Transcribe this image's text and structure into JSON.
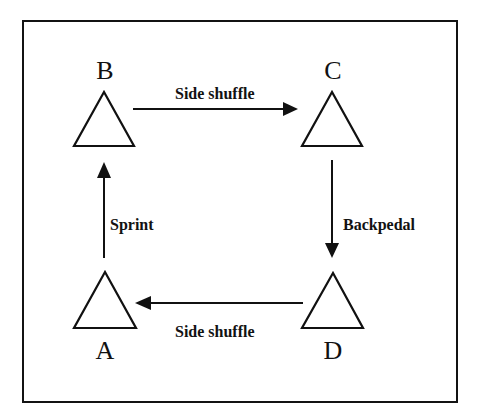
{
  "figure": {
    "type": "cycle-drill-diagram",
    "frame": {
      "border_color": "#131313",
      "background": "#ffffff"
    },
    "nodes": [
      {
        "id": "B",
        "label": "B",
        "shape": "triangle",
        "position": "top-left"
      },
      {
        "id": "C",
        "label": "C",
        "shape": "triangle",
        "position": "top-right"
      },
      {
        "id": "A",
        "label": "A",
        "shape": "triangle",
        "position": "bottom-left"
      },
      {
        "id": "D",
        "label": "D",
        "shape": "triangle",
        "position": "bottom-right"
      }
    ],
    "edges": [
      {
        "id": "b-to-c",
        "label": "Side shuffle",
        "from": "B",
        "to": "C",
        "direction": "right"
      },
      {
        "id": "c-to-d",
        "label": "Backpedal",
        "from": "C",
        "to": "D",
        "direction": "down"
      },
      {
        "id": "d-to-a",
        "label": "Side shuffle",
        "from": "D",
        "to": "A",
        "direction": "left"
      },
      {
        "id": "a-to-b",
        "label": "Sprint",
        "from": "A",
        "to": "B",
        "direction": "up"
      }
    ],
    "stroke_color": "#111111"
  }
}
